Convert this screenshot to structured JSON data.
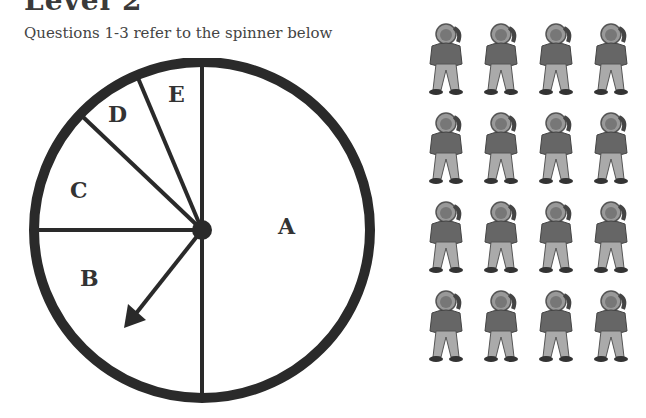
{
  "header": {
    "title": "Level 2"
  },
  "intro": {
    "text": "Questions 1-3 refer to the spinner below"
  },
  "spinner": {
    "sections": [
      {
        "label": "A",
        "description": "right half"
      },
      {
        "label": "B",
        "description": "lower-left quarter"
      },
      {
        "label": "C",
        "description": "left section above horizontal"
      },
      {
        "label": "D",
        "description": "small upper wedge"
      },
      {
        "label": "E",
        "description": "small top wedge"
      }
    ],
    "arrow": "points into section B"
  },
  "figures": {
    "rows": 4,
    "cols": 4,
    "count": 16,
    "icon": "boy-on-phone-icon"
  }
}
